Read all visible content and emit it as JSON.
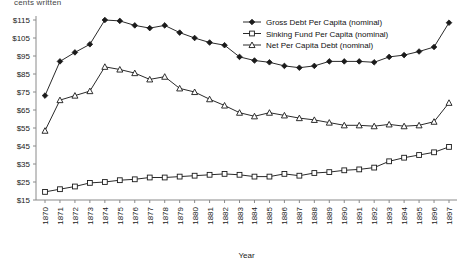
{
  "axis_top_label": "cents written",
  "legend": {
    "position": "top-right",
    "items": [
      {
        "label": "Gross Debt Per Capita (nominal)",
        "marker": "filled-diamond-icon"
      },
      {
        "label": "Sinking Fund Per Capita (nominal)",
        "marker": "open-square-icon"
      },
      {
        "label": "Net Per Capita Debt (nominal)",
        "marker": "open-triangle-icon"
      }
    ]
  },
  "chart_data": {
    "type": "line",
    "title": "",
    "xlabel": "Year",
    "ylabel": "",
    "grid": false,
    "xlim": [
      1870,
      1897
    ],
    "ylim": [
      15,
      115
    ],
    "ytick_labels": [
      "$115",
      "$105",
      "$95",
      "$85",
      "$75",
      "$65",
      "$55",
      "$45",
      "$35",
      "$25",
      "$15"
    ],
    "ytick_values": [
      115,
      105,
      95,
      85,
      75,
      65,
      55,
      45,
      35,
      25,
      15
    ],
    "categories": [
      "1870",
      "1871",
      "1872",
      "1873",
      "1874",
      "1875",
      "1876",
      "1877",
      "1878",
      "1879",
      "1880",
      "1881",
      "1882",
      "1883",
      "1884",
      "1885",
      "1886",
      "1887",
      "1888",
      "1889",
      "1890",
      "1891",
      "1892",
      "1893",
      "1894",
      "1895",
      "1896",
      "1897"
    ],
    "series": [
      {
        "name": "Gross Debt Per Capita (nominal)",
        "marker": "filled-diamond-icon",
        "values": [
          73.0,
          92.0,
          97.0,
          101.5,
          115.0,
          114.5,
          112.0,
          110.5,
          112.0,
          108.0,
          105.0,
          102.5,
          101.0,
          94.5,
          92.5,
          91.5,
          89.5,
          88.5,
          89.5,
          92.0,
          92.0,
          92.0,
          91.5,
          94.5,
          95.5,
          97.5,
          100.0,
          113.5
        ]
      },
      {
        "name": "Sinking Fund Per Capita (nominal)",
        "marker": "open-square-icon",
        "values": [
          19.5,
          21.0,
          22.5,
          24.5,
          25.0,
          26.0,
          26.5,
          27.5,
          27.5,
          28.0,
          28.5,
          29.0,
          29.5,
          29.0,
          28.0,
          28.0,
          29.5,
          28.5,
          30.0,
          30.5,
          31.5,
          32.0,
          33.0,
          36.5,
          38.5,
          40.0,
          41.5,
          44.5
        ]
      },
      {
        "name": "Net Per Capita Debt (nominal)",
        "marker": "open-triangle-icon",
        "values": [
          53.5,
          70.5,
          73.0,
          75.5,
          89.0,
          87.5,
          85.5,
          82.0,
          83.5,
          77.0,
          75.0,
          71.0,
          67.5,
          63.5,
          61.5,
          63.5,
          62.0,
          60.5,
          59.5,
          58.0,
          56.5,
          56.5,
          56.0,
          57.0,
          56.0,
          56.5,
          58.5,
          69.0
        ]
      }
    ]
  }
}
